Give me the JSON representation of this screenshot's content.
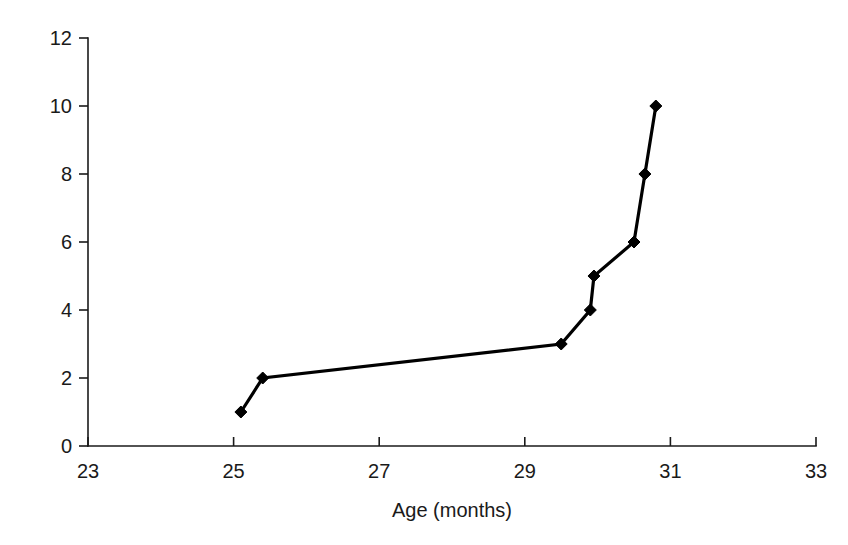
{
  "chart_data": {
    "type": "line",
    "title": "",
    "subtitle": "",
    "xlabel": "Age (months)",
    "ylabel": "Cumulative number of verbs",
    "xlim": [
      23,
      33
    ],
    "ylim": [
      0,
      12
    ],
    "xticks": [
      23,
      25,
      27,
      29,
      31,
      33
    ],
    "xtick_labels": [
      "23",
      "25",
      "27",
      "29",
      "31",
      "33"
    ],
    "yticks": [
      0,
      2,
      4,
      6,
      8,
      10,
      12
    ],
    "ytick_labels": [
      "0",
      "2",
      "4",
      "6",
      "8",
      "10",
      "12"
    ],
    "grid": false,
    "legend": null,
    "legend_position": "none",
    "marker": "diamond",
    "line_color": "#000000",
    "marker_color": "#000000",
    "background_color": "#ffffff",
    "series": [
      {
        "name": "Cumulative verbs",
        "x": [
          25.1,
          25.4,
          29.5,
          29.9,
          29.95,
          30.5,
          30.65,
          30.8
        ],
        "y": [
          1,
          2,
          3,
          4,
          5,
          6,
          8,
          10
        ]
      }
    ],
    "points": [
      {
        "x": 25.1,
        "y": 1
      },
      {
        "x": 25.4,
        "y": 2
      },
      {
        "x": 29.5,
        "y": 3
      },
      {
        "x": 29.9,
        "y": 4
      },
      {
        "x": 29.95,
        "y": 5
      },
      {
        "x": 30.5,
        "y": 6
      },
      {
        "x": 30.65,
        "y": 8
      },
      {
        "x": 30.8,
        "y": 10
      }
    ],
    "annotations": []
  }
}
